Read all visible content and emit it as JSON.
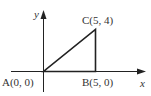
{
  "diagram": {
    "type": "coordinate-triangle",
    "axes": {
      "x_label": "x",
      "y_label": "y"
    },
    "points": [
      {
        "name": "A",
        "label": "A(0, 0)",
        "x": 0,
        "y": 0
      },
      {
        "name": "B",
        "label": "B(5, 0)",
        "x": 5,
        "y": 0
      },
      {
        "name": "C",
        "label": "C(5, 4)",
        "x": 5,
        "y": 4
      }
    ],
    "colors": {
      "stroke": "#222222",
      "text": "#333333",
      "background": "#ffffff"
    }
  }
}
